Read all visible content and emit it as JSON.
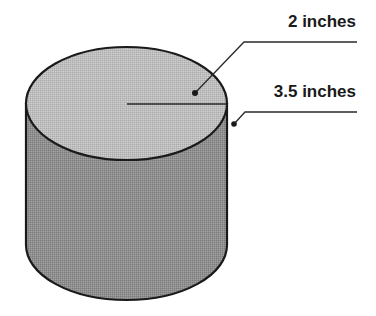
{
  "diagram": {
    "type": "cylinder-dimension-diagram",
    "colors": {
      "top_face": "#bdbdbd",
      "side_face": "#8e8e8e",
      "outline": "#1a1a1a",
      "background": "#ffffff"
    },
    "labels": {
      "top_label": "2 inches",
      "bottom_label": "3.5 inches"
    },
    "callouts": [
      {
        "label_ref": "top_label",
        "points_to": "radius-on-top-face"
      },
      {
        "label_ref": "bottom_label",
        "points_to": "side-edge-of-cylinder"
      }
    ]
  }
}
